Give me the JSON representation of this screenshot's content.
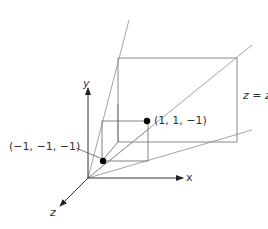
{
  "diagram": {
    "axes": {
      "x_label": "x",
      "y_label": "y",
      "z_label": "z"
    },
    "points": [
      {
        "label": "(−1, −1, −1)",
        "coords": [
          -1,
          -1,
          -1
        ]
      },
      {
        "label": "(1, 1, −1)",
        "coords": [
          1,
          1,
          -1
        ]
      }
    ],
    "plane_label": {
      "var": "z",
      "eq": " = ",
      "rhs": "z",
      "subscript": "min"
    },
    "colors": {
      "line": "#8a8a8a",
      "axis": "#333333",
      "point": "#000000",
      "text": "#333333"
    }
  }
}
